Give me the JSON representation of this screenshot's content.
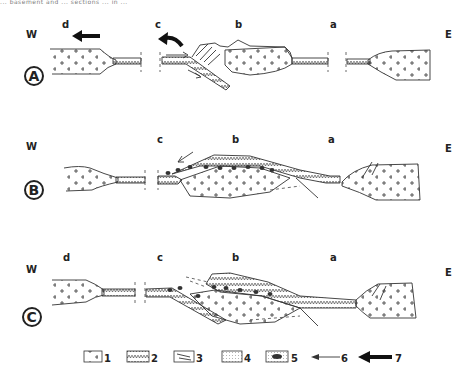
{
  "caption": "... basement and ... sections ... in ...",
  "orientation": {
    "west": "W",
    "east": "E"
  },
  "panels": [
    {
      "id": "A",
      "zones": [
        "d",
        "c",
        "b",
        "a"
      ]
    },
    {
      "id": "B",
      "zones": [
        "c",
        "b",
        "a"
      ]
    },
    {
      "id": "C",
      "zones": [
        "d",
        "c",
        "b",
        "a"
      ]
    }
  ],
  "legend": [
    {
      "num": "1",
      "symbol": "crosses-pattern"
    },
    {
      "num": "2",
      "symbol": "v-pattern"
    },
    {
      "num": "3",
      "symbol": "thrust-slices"
    },
    {
      "num": "4",
      "symbol": "dotted-pattern"
    },
    {
      "num": "5",
      "symbol": "ophiolite-blocks"
    },
    {
      "num": "6",
      "symbol": "thin-arrow"
    },
    {
      "num": "7",
      "symbol": "thick-arrow"
    }
  ]
}
